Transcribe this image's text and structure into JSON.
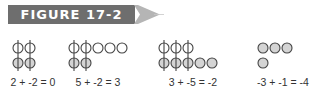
{
  "figure": {
    "label": "FIGURE 17-2",
    "banner_color": "#6e6e6e",
    "arrow_color": "#b5b5b5"
  },
  "legend": {
    "positive_chip": "white circle",
    "negative_chip": "gray circle",
    "zero_pair": "vertical line through paired positive and negative chips"
  },
  "colors": {
    "positive_fill": "#ffffff",
    "negative_fill": "#d4d4d4",
    "stroke": "#444444"
  },
  "groups": [
    {
      "equation": "2 + -2 = 0",
      "positive": 2,
      "negative": 2,
      "zero_pairs": 2
    },
    {
      "equation": "5 + -2 = 3",
      "positive": 5,
      "negative": 2,
      "zero_pairs": 2
    },
    {
      "equation": "3 + -5 = -2",
      "positive": 3,
      "negative": 5,
      "zero_pairs": 3
    },
    {
      "equation": "-3 + -1 = -4",
      "positive": 0,
      "negative": 4,
      "zero_pairs": 0
    }
  ]
}
